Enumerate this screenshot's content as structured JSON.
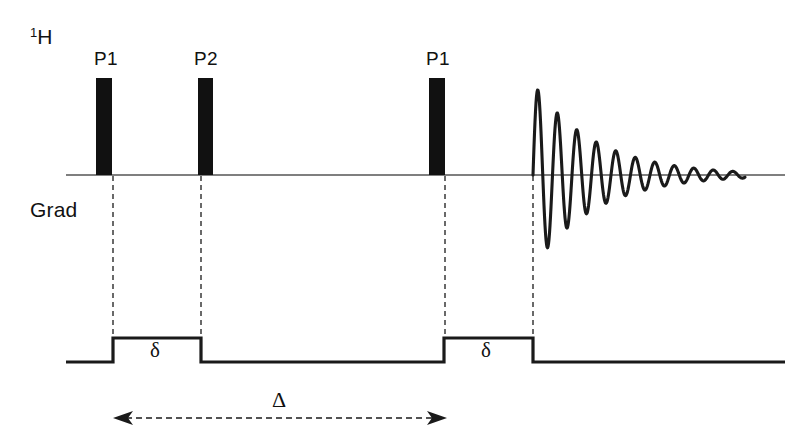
{
  "figure": {
    "type": "nmr-pulse-sequence-diagram",
    "title": "",
    "background_color": "#ffffff",
    "line_color": "#1a1a1a",
    "axis_color": "#555555",
    "pulse_fill": "#111111"
  },
  "channels": [
    {
      "id": "rf",
      "label_html": "1H",
      "label_superscript": "1",
      "label_base": "H",
      "label_x": 30,
      "label_y": 26,
      "baseline_y": 175,
      "baseline_x_start": 66,
      "baseline_x_end": 785
    },
    {
      "id": "grad",
      "label": "Grad",
      "label_x": 30,
      "label_y": 199,
      "baseline_y": 362,
      "baseline_x_start": 66,
      "baseline_x_end": 785
    }
  ],
  "rf_pulses": [
    {
      "name": "P1",
      "label": "P1",
      "x": 96,
      "width": 16,
      "top_y": 78,
      "bottom_y": 175,
      "label_x": 94,
      "label_y": 49
    },
    {
      "name": "P2",
      "label": "P2",
      "x": 198,
      "width": 15,
      "top_y": 78,
      "bottom_y": 175,
      "label_x": 194,
      "label_y": 49
    },
    {
      "name": "P1b",
      "label": "P1",
      "x": 429,
      "width": 16,
      "top_y": 78,
      "bottom_y": 175,
      "label_x": 426,
      "label_y": 49
    }
  ],
  "gradient_pulses": [
    {
      "name": "delta-1",
      "label": "δ",
      "x_start": 113,
      "x_end": 201,
      "top_y": 338,
      "base_y": 362,
      "label_x": 150,
      "label_y": 340
    },
    {
      "name": "delta-2",
      "label": "δ",
      "x_start": 444,
      "x_end": 533,
      "top_y": 338,
      "base_y": 362,
      "label_x": 481,
      "label_y": 340
    }
  ],
  "dashed_guides": [
    {
      "x": 113,
      "y_top": 176,
      "y_bottom": 338
    },
    {
      "x": 201,
      "y_top": 176,
      "y_bottom": 338
    },
    {
      "x": 445,
      "y_top": 176,
      "y_bottom": 338
    },
    {
      "x": 533,
      "y_top": 176,
      "y_bottom": 338
    }
  ],
  "interval_arrow": {
    "name": "big-delta",
    "label": "Δ",
    "x_start": 115,
    "x_end": 445,
    "y": 418,
    "label_x": 272,
    "label_y": 389,
    "style": "dashed double-headed"
  },
  "fid": {
    "name": "free-induction-decay",
    "x_start": 533,
    "x_end": 745,
    "center_y": 175,
    "peak_top_y": 83,
    "first_trough_y": 256,
    "cycles": 11,
    "period_px": 19.5,
    "initial_amplitude": 92,
    "decay_constant_px": 62,
    "phase": "rising-from-zero"
  },
  "chart_data": {
    "type": "line",
    "xlabel": "",
    "ylabel": "",
    "legend": [],
    "series": [
      {
        "name": "1H channel",
        "description": "RF pulse train P1, P2, P1 followed by detected FID"
      },
      {
        "name": "Grad channel",
        "description": "Two gradient pulses of duration delta separated by Delta"
      }
    ],
    "annotations": [
      "1H",
      "Grad",
      "P1",
      "P2",
      "P1",
      "δ",
      "δ",
      "Δ"
    ]
  }
}
